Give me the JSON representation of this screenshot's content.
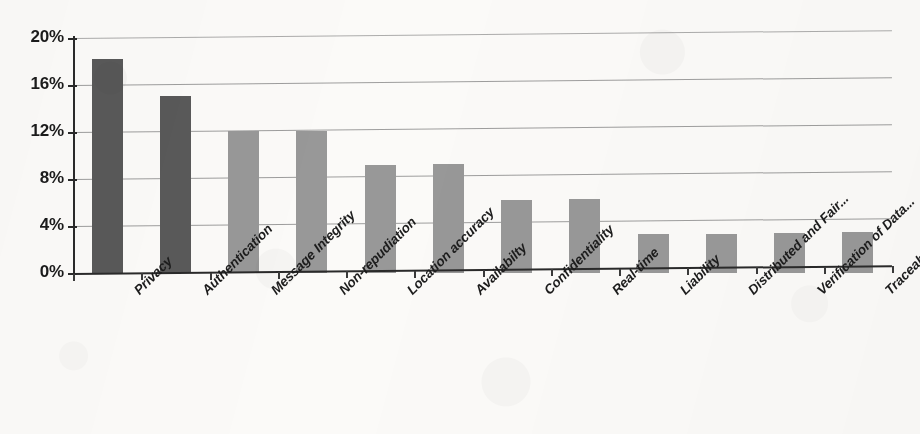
{
  "chart_data": {
    "type": "bar",
    "title": "",
    "subtitle": "",
    "xlabel": "",
    "ylabel": "",
    "ylim": [
      0,
      20
    ],
    "ytick_labels": [
      "0%",
      "4%",
      "8%",
      "12%",
      "16%",
      "20%"
    ],
    "ytick_values": [
      0,
      4,
      8,
      12,
      16,
      20
    ],
    "grid": true,
    "grid_axis": "y",
    "legend": false,
    "legend_position": "none",
    "value_unit": "%",
    "categories": [
      "Privacy",
      "Authentication",
      "Message Integrity",
      "Non-repudiation",
      "Location accuracy",
      "Availabilty",
      "Confidentiality",
      "Real-time",
      "Liability",
      "Distributed and Fair...",
      "Verification of Data...",
      "Traceability and..."
    ],
    "values": [
      18.2,
      15.1,
      12.1,
      12.1,
      9.2,
      9.3,
      6.2,
      6.3,
      3.3,
      3.3,
      3.4,
      3.5
    ],
    "bar_colors": [
      "#595959",
      "#595959",
      "#989898",
      "#989898",
      "#989898",
      "#989898",
      "#989898",
      "#989898",
      "#989898",
      "#989898",
      "#989898",
      "#989898"
    ]
  },
  "style": {
    "background": "#fbfaf8",
    "dark_bar": "#595959",
    "light_bar": "#989898",
    "gridline": "#8d8d8d",
    "axis": "#2a2a2a",
    "text": "#1b1b1b"
  }
}
